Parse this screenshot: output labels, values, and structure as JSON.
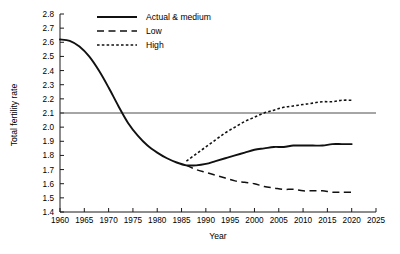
{
  "chart_data": {
    "type": "line",
    "title": "",
    "xlabel": "Year",
    "ylabel": "Total fertility rate",
    "xlim": [
      1960,
      2025
    ],
    "ylim": [
      1.4,
      2.8
    ],
    "xticks": [
      1960,
      1965,
      1970,
      1975,
      1980,
      1985,
      1990,
      1995,
      2000,
      2005,
      2010,
      2015,
      2020,
      2025
    ],
    "yticks": [
      1.4,
      1.5,
      1.6,
      1.7,
      1.8,
      1.9,
      2.0,
      2.1,
      2.2,
      2.3,
      2.4,
      2.5,
      2.6,
      2.7,
      2.8
    ],
    "xtick_labels": [
      "1960",
      "1965",
      "1970",
      "1975",
      "1980",
      "1985",
      "1990",
      "1995",
      "2000",
      "2005",
      "2010",
      "2015",
      "2020",
      "2025"
    ],
    "ytick_labels": [
      "1.4",
      "1.5",
      "1.6",
      "1.7",
      "1.8",
      "1.9",
      "2.0",
      "2.1",
      "2.2",
      "2.3",
      "2.4",
      "2.5",
      "2.6",
      "2.7",
      "2.8"
    ],
    "grid": false,
    "legend_position": "top-center",
    "reference_line": {
      "name": "replacement-level",
      "value": 2.1,
      "orientation": "horizontal",
      "label": ""
    },
    "series": [
      {
        "name": "Actual & medium",
        "style": "solid",
        "x": [
          1960,
          1962,
          1964,
          1966,
          1968,
          1970,
          1972,
          1974,
          1976,
          1978,
          1980,
          1982,
          1984,
          1986,
          1988,
          1990,
          1992,
          1994,
          1996,
          1998,
          2000,
          2002,
          2004,
          2006,
          2008,
          2010,
          2012,
          2014,
          2016,
          2018,
          2020
        ],
        "values": [
          2.62,
          2.61,
          2.57,
          2.5,
          2.4,
          2.28,
          2.15,
          2.03,
          1.94,
          1.87,
          1.82,
          1.78,
          1.75,
          1.73,
          1.73,
          1.74,
          1.76,
          1.78,
          1.8,
          1.82,
          1.84,
          1.85,
          1.86,
          1.86,
          1.87,
          1.87,
          1.87,
          1.87,
          1.88,
          1.88,
          1.88
        ]
      },
      {
        "name": "Low",
        "style": "dashed",
        "x": [
          1986,
          1988,
          1990,
          1992,
          1994,
          1996,
          1998,
          2000,
          2002,
          2004,
          2006,
          2008,
          2010,
          2012,
          2014,
          2016,
          2018,
          2020
        ],
        "values": [
          1.73,
          1.7,
          1.68,
          1.66,
          1.64,
          1.62,
          1.61,
          1.6,
          1.58,
          1.57,
          1.56,
          1.56,
          1.55,
          1.55,
          1.55,
          1.54,
          1.54,
          1.54
        ]
      },
      {
        "name": "High",
        "style": "dotted",
        "x": [
          1986,
          1988,
          1990,
          1992,
          1994,
          1996,
          1998,
          2000,
          2002,
          2004,
          2006,
          2008,
          2010,
          2012,
          2014,
          2016,
          2018,
          2020
        ],
        "values": [
          1.76,
          1.81,
          1.86,
          1.91,
          1.96,
          2.0,
          2.04,
          2.07,
          2.1,
          2.12,
          2.14,
          2.15,
          2.16,
          2.17,
          2.18,
          2.18,
          2.19,
          2.19
        ]
      }
    ],
    "legend_entries": [
      {
        "label": "Actual & medium",
        "style": "solid"
      },
      {
        "label": "Low",
        "style": "dashed"
      },
      {
        "label": "High",
        "style": "dotted"
      }
    ],
    "colors": {
      "series": "#111111",
      "axis": "#1a1a1a",
      "reference_line": "#4d4d4d",
      "background": "#ffffff"
    }
  }
}
